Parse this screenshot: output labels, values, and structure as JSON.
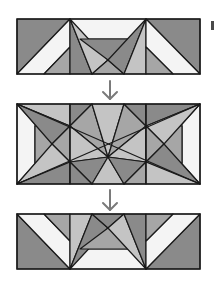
{
  "diagram": {
    "colors": {
      "dark": "#8a8a8a",
      "medium": "#a6a6a6",
      "light": "#c4c4c4",
      "white": "#f4f4f4",
      "line": "#1a1a1a",
      "arrow": "#7a7a7a"
    },
    "panels": [
      {
        "id": "top",
        "label": ""
      },
      {
        "id": "middle",
        "label": ""
      },
      {
        "id": "bottom",
        "label": ""
      }
    ],
    "arrows": [
      {
        "from": "top",
        "to": "middle",
        "direction": "down"
      },
      {
        "from": "middle",
        "to": "bottom",
        "direction": "down"
      }
    ]
  }
}
